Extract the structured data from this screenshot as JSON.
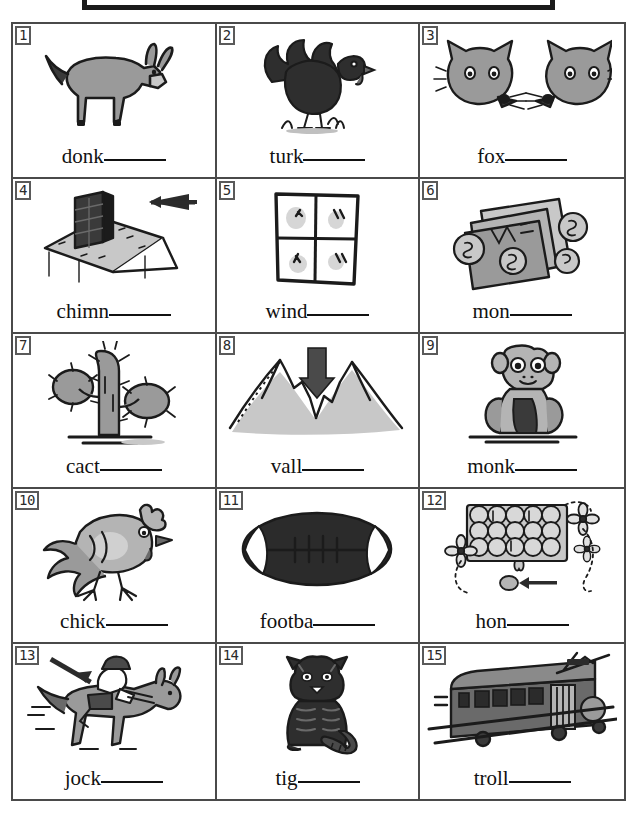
{
  "title_box": {
    "text": ""
  },
  "palette": {
    "ink": "#1b1b1b",
    "grid_line": "#4a4a4a",
    "badge_border": "#5a5a5a",
    "art_gray": "#9a9a9a",
    "art_dark": "#3a3a3a",
    "art_light": "#c8c8c8",
    "paper": "#ffffff"
  },
  "worksheet": {
    "columns": 3,
    "rows": 5,
    "items": [
      {
        "number": "1",
        "word": "donk",
        "blank": "______",
        "picture": "donkey-picture"
      },
      {
        "number": "2",
        "word": "turk",
        "blank": "______",
        "picture": "turkey-picture"
      },
      {
        "number": "3",
        "word": "fox",
        "blank": "______",
        "picture": "foxes-picture"
      },
      {
        "number": "4",
        "word": "chimn",
        "blank": "______",
        "picture": "chimney-picture"
      },
      {
        "number": "5",
        "word": "wind",
        "blank": "______",
        "picture": "window-picture"
      },
      {
        "number": "6",
        "word": "mon",
        "blank": "______",
        "picture": "money-picture"
      },
      {
        "number": "7",
        "word": "cact",
        "blank": "______",
        "picture": "cactus-picture"
      },
      {
        "number": "8",
        "word": "vall",
        "blank": "______",
        "picture": "valley-picture"
      },
      {
        "number": "9",
        "word": "monk",
        "blank": "______",
        "picture": "monkey-picture"
      },
      {
        "number": "10",
        "word": "chick",
        "blank": "______",
        "picture": "chicken-picture"
      },
      {
        "number": "11",
        "word": "footba",
        "blank": "______",
        "picture": "football-picture"
      },
      {
        "number": "12",
        "word": "hon",
        "blank": "______",
        "picture": "honey-picture"
      },
      {
        "number": "13",
        "word": "jock",
        "blank": "______",
        "picture": "jockey-picture"
      },
      {
        "number": "14",
        "word": "tig",
        "blank": "______",
        "picture": "tiger-picture"
      },
      {
        "number": "15",
        "word": "troll",
        "blank": "______",
        "picture": "trolley-picture"
      }
    ]
  }
}
